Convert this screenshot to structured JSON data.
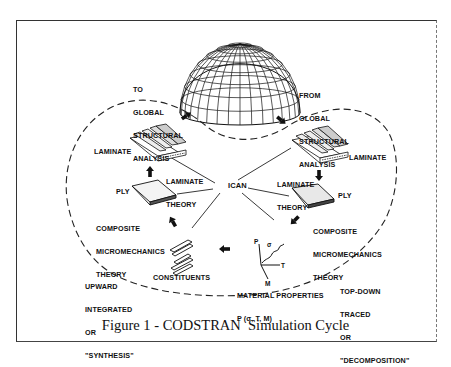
{
  "figure": {
    "caption": "Figure 1 - CODSTRAN  Simulation Cycle",
    "center_node": "ICAN",
    "nodes": {
      "global_structure": "GLOBAL STRUCTURE (DOME)",
      "laminate_left": "LAMINATE",
      "laminate_right": "LAMINATE",
      "ply_left": "PLY",
      "ply_right": "PLY",
      "constituents": "CONSTITUENTS",
      "material_properties_line1": "MATERIAL PROPERTIES",
      "material_properties_line2": "P (σ, T, M)"
    },
    "theories": {
      "laminate_theory_left": [
        "LAMINATE",
        "THEORY"
      ],
      "laminate_theory_right": [
        "LAMINATE",
        "THEORY"
      ],
      "micromech_left": [
        "COMPOSITE",
        "MICROMECHANICS",
        "THEORY"
      ],
      "micromech_right": [
        "COMPOSITE",
        "MICROMECHANICS",
        "THEORY"
      ]
    },
    "flows": {
      "to_global": [
        "TO",
        "GLOBAL",
        "STRUCTURAL",
        "ANALYSIS"
      ],
      "from_global": [
        "FROM",
        "GLOBAL",
        "STRUCTURAL",
        "ANALYSIS"
      ],
      "upward": [
        "UPWARD",
        "INTEGRATED",
        "OR",
        "\"SYNTHESIS\""
      ],
      "topdown": [
        "TOP-DOWN",
        "TRACED",
        "OR",
        "\"DECOMPOSITION\""
      ]
    },
    "graph_axes": {
      "p": "P",
      "t": "T",
      "m": "M",
      "sigma": "σ"
    }
  }
}
